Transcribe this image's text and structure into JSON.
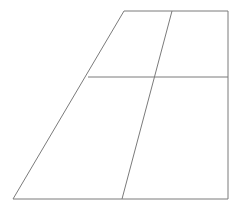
{
  "figure": {
    "shape_name": "trapezoid",
    "background_color": "#ffffff",
    "stroke_color": "#7b7b7b",
    "stroke_width": 1,
    "canvas": {
      "width": 243,
      "height": 209
    },
    "vertices": {
      "top_left": {
        "x": 124,
        "y": 11
      },
      "top_right": {
        "x": 228,
        "y": 11
      },
      "bottom_right": {
        "x": 228,
        "y": 199
      },
      "bottom_left": {
        "x": 13,
        "y": 199
      }
    },
    "outline_points": "124,11 228,11 228,199 13,199",
    "interior_lines": [
      {
        "name": "horizontal-divider",
        "x1": 88,
        "y1": 77,
        "x2": 228,
        "y2": 77
      },
      {
        "name": "diagonal-divider",
        "x1": 172,
        "y1": 11,
        "x2": 122,
        "y2": 199
      }
    ],
    "intersection_points": [
      {
        "name": "horizontal-meets-left-edge",
        "x": 88,
        "y": 77
      },
      {
        "name": "horizontal-meets-right-edge",
        "x": 228,
        "y": 77
      },
      {
        "name": "diagonal-meets-horizontal",
        "x": 152,
        "y": 77
      },
      {
        "name": "diagonal-meets-top-edge",
        "x": 172,
        "y": 11
      },
      {
        "name": "diagonal-meets-bottom-edge",
        "x": 122,
        "y": 199
      }
    ],
    "region_count": 4
  }
}
